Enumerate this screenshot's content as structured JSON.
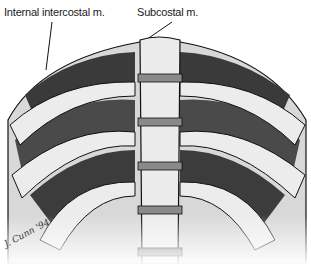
{
  "diagram": {
    "labels": {
      "internal_intercostal": "Internal intercostal m.",
      "subcostal": "Subcostal m."
    },
    "signature": "J. Cunn '94",
    "colors": {
      "muscle_dark": "#3a3a3a",
      "muscle_mid": "#5a5a5a",
      "bone": "#e6e6e6",
      "disc": "#8a8a8a",
      "outline": "#111111"
    }
  }
}
